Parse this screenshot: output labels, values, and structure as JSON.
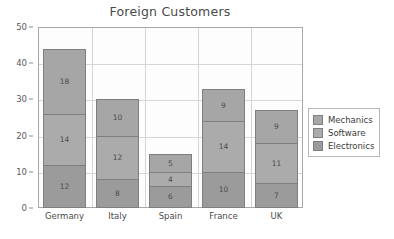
{
  "chart_data": {
    "type": "bar",
    "stacked": true,
    "title": "Foreign Customers",
    "xlabel": "",
    "ylabel": "",
    "ylim": [
      0,
      50
    ],
    "yticks": [
      0,
      10,
      20,
      30,
      40,
      50
    ],
    "grid": true,
    "legend_position": "right",
    "categories": [
      "Germany",
      "Italy",
      "Spain",
      "France",
      "UK"
    ],
    "series": [
      {
        "name": "Electronics",
        "values": [
          12,
          8,
          6,
          10,
          7
        ],
        "color": "#9b9b9b"
      },
      {
        "name": "Software",
        "values": [
          14,
          12,
          4,
          14,
          11
        ],
        "color": "#ababab"
      },
      {
        "name": "Mechanics",
        "values": [
          18,
          10,
          5,
          9,
          9
        ],
        "color": "#a6a6a6"
      }
    ],
    "totals": [
      44,
      30,
      15,
      33,
      27
    ]
  },
  "legend": {
    "items": [
      {
        "label": "Mechanics",
        "color": "#a6a6a6"
      },
      {
        "label": "Software",
        "color": "#ababab"
      },
      {
        "label": "Electronics",
        "color": "#9b9b9b"
      }
    ]
  },
  "colors": {
    "background": "#ffffff",
    "plot_background": "#fdfdfd",
    "gridline": "#d6d6d6",
    "axis": "#a8a8a8",
    "title_text": "#4a4a4a",
    "label_text": "#4a4a4a",
    "bar_border": "#7f7f7f"
  }
}
